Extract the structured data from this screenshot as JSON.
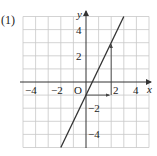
{
  "problem_label": "(1)",
  "chart_data": {
    "type": "line",
    "title": "",
    "xlabel": "x",
    "ylabel": "y",
    "origin_label": "O",
    "xlim": [
      -5,
      5
    ],
    "ylim": [
      -5,
      5
    ],
    "grid": true,
    "x_ticks": [
      {
        "value": -4,
        "label": "−4"
      },
      {
        "value": -2,
        "label": "−2"
      },
      {
        "value": 2,
        "label": "2"
      },
      {
        "value": 4,
        "label": "4"
      }
    ],
    "y_ticks": [
      {
        "value": 4,
        "label": "4"
      },
      {
        "value": 2,
        "label": "2"
      },
      {
        "value": -2,
        "label": "−2"
      },
      {
        "value": -4,
        "label": "−4"
      }
    ],
    "series": [
      {
        "name": "y = 2x − 1",
        "x": [
          -2,
          3
        ],
        "y": [
          -5,
          5
        ]
      }
    ],
    "annotations": [
      {
        "type": "arrow",
        "from": [
          0,
          -1
        ],
        "to": [
          2,
          -1
        ],
        "meaning": "run +2"
      },
      {
        "type": "arrow",
        "from": [
          2,
          -1
        ],
        "to": [
          2,
          3
        ],
        "meaning": "rise +4"
      }
    ]
  },
  "colors": {
    "grid": "#c8c8c8",
    "axis": "#333333",
    "line": "#333333"
  }
}
